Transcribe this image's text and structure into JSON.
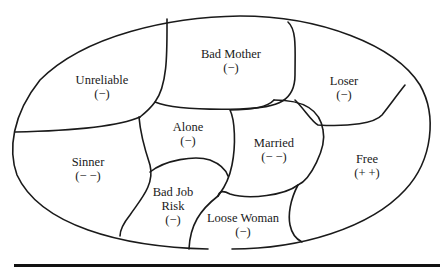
{
  "diagram": {
    "type": "identity-region map",
    "regions": [
      {
        "id": "unreliable",
        "label": "Unreliable",
        "valence": "(−)",
        "x": 102,
        "y": 80
      },
      {
        "id": "bad-mother",
        "label": "Bad Mother",
        "valence": "(−)",
        "x": 231,
        "y": 55
      },
      {
        "id": "loser",
        "label": "Loser",
        "valence": "(−)",
        "x": 344,
        "y": 81
      },
      {
        "id": "alone",
        "label": "Alone",
        "valence": "(−)",
        "x": 188,
        "y": 127
      },
      {
        "id": "married",
        "label": "Married",
        "valence": "(− −)",
        "x": 274,
        "y": 143
      },
      {
        "id": "sinner",
        "label": "Sinner",
        "valence": "(− −)",
        "x": 88,
        "y": 162
      },
      {
        "id": "free",
        "label": "Free",
        "valence": "(+ +)",
        "x": 367,
        "y": 159
      },
      {
        "id": "bad-job-risk",
        "label": "Bad Job",
        "label2": "Risk",
        "valence": "(−)",
        "x": 173,
        "y": 192
      },
      {
        "id": "loose-woman",
        "label": "Loose Woman",
        "valence": "(−)",
        "x": 243,
        "y": 218
      }
    ]
  }
}
